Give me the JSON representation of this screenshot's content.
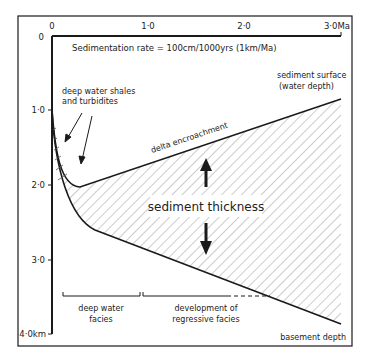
{
  "title": "Sedimentation rate = 100cm/1000yrs  (1km/Ma)",
  "x_axis": {
    "ticks": [
      "0",
      "1·0",
      "2·0",
      "3·0Ma"
    ],
    "unit": "Ma"
  },
  "y_axis": {
    "ticks": [
      "0",
      "1·0",
      "2·0",
      "3·0",
      "4·0km"
    ],
    "unit": "km"
  },
  "labels": {
    "deep_water_1": "deep water shales",
    "deep_water_2": "and turbidites",
    "surface_1": "sediment surface",
    "surface_2": "(water depth)",
    "delta": "delta encroachment",
    "thickness": "sediment thickness",
    "basement": "basement depth",
    "facies_deep_1": "deep water",
    "facies_deep_2": "facies",
    "facies_reg_1": "development of",
    "facies_reg_2": "regressive facies"
  },
  "colors": {
    "line": "#1a1a1a",
    "hatch": "#9a9a9a"
  }
}
